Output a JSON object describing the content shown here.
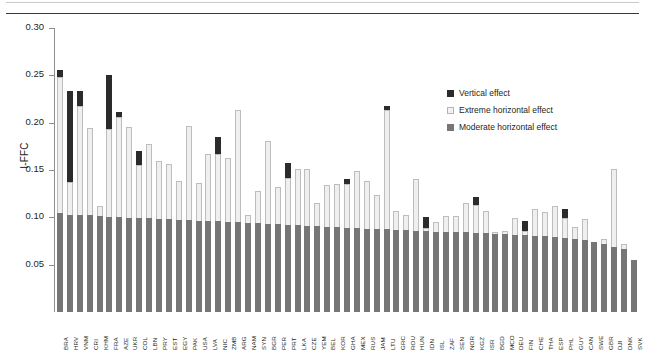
{
  "figure": {
    "caption_fragment_left": "",
    "caption_fragment_mid": "",
    "caption_fragment_right": ""
  },
  "legend": {
    "position": "top-right",
    "items": [
      {
        "label": "Vertical effect",
        "color": "#2b2b2b",
        "name": "legend-vertical-effect"
      },
      {
        "label": "Extreme horizontal effect",
        "color": "#f2f2f2",
        "name": "legend-extreme-horizontal-effect"
      },
      {
        "label": "Moderate horizontal effect",
        "color": "#767676",
        "name": "legend-moderate-horizontal-effect"
      }
    ]
  },
  "chart_data": {
    "type": "bar",
    "stacked": true,
    "title": "",
    "xlabel": "",
    "ylabel": "I-FFC",
    "ylim": [
      0,
      0.3
    ],
    "yticks": [
      0.05,
      0.1,
      0.15,
      0.2,
      0.25,
      0.3
    ],
    "ytick_labels": [
      "0.05",
      "0.10",
      "0.15",
      "0.20",
      "0.25",
      "0.30"
    ],
    "grid": false,
    "legend_position": "top-right",
    "categories": [
      "BRA",
      "HRV",
      "VNM",
      "CRI",
      "KHM",
      "FRA",
      "AZE",
      "UKR",
      "COL",
      "LBN",
      "PRY",
      "EST",
      "EGY",
      "PAK",
      "USA",
      "LVA",
      "NIC",
      "ZMB",
      "ARG",
      "NAM",
      "SYN",
      "BGR",
      "PER",
      "PRT",
      "LKA",
      "CZE",
      "YEM",
      "BEL",
      "KOR",
      "GHA",
      "MEX",
      "RUS",
      "JAM",
      "LTU",
      "GRC",
      "ROU",
      "HUN",
      "IDN",
      "ISL",
      "ZAF",
      "SEN",
      "NOR",
      "KGZ",
      "ISR",
      "BGD",
      "MCO",
      "DEU",
      "FIN",
      "CHE",
      "THA",
      "ESP",
      "PHL",
      "GUY",
      "CAN",
      "SWE",
      "GBR",
      "DJI",
      "DNK",
      "SVK"
    ],
    "series": [
      {
        "name": "Moderate horizontal effect",
        "color": "#767676",
        "values": [
          0.105,
          0.103,
          0.102,
          0.102,
          0.101,
          0.1,
          0.1,
          0.099,
          0.099,
          0.099,
          0.098,
          0.098,
          0.097,
          0.097,
          0.096,
          0.096,
          0.096,
          0.095,
          0.095,
          0.094,
          0.094,
          0.093,
          0.093,
          0.092,
          0.092,
          0.091,
          0.091,
          0.09,
          0.09,
          0.089,
          0.089,
          0.088,
          0.088,
          0.088,
          0.087,
          0.087,
          0.086,
          0.086,
          0.085,
          0.085,
          0.084,
          0.084,
          0.083,
          0.083,
          0.082,
          0.082,
          0.081,
          0.081,
          0.08,
          0.08,
          0.079,
          0.078,
          0.077,
          0.076,
          0.074,
          0.072,
          0.069,
          0.067,
          0.055
        ]
      },
      {
        "name": "Extreme horizontal effect",
        "color": "#efefef",
        "values": [
          0.143,
          0.034,
          0.116,
          0.092,
          0.011,
          0.093,
          0.106,
          0.096,
          0.056,
          0.079,
          0.062,
          0.058,
          0.041,
          0.1,
          0.04,
          0.071,
          0.071,
          0.068,
          0.118,
          0.008,
          0.034,
          0.088,
          0.039,
          0.05,
          0.059,
          0.06,
          0.024,
          0.044,
          0.045,
          0.046,
          0.06,
          0.05,
          0.036,
          0.125,
          0.02,
          0.015,
          0.054,
          0.003,
          0.01,
          0.016,
          0.017,
          0.031,
          0.03,
          0.024,
          0.002,
          0.004,
          0.018,
          0.005,
          0.029,
          0.026,
          0.033,
          0.021,
          0.013,
          0.022,
          0.0,
          0.005,
          0.082,
          0.005,
          0.0
        ]
      },
      {
        "name": "Vertical effect",
        "color": "#2b2b2b",
        "values": [
          0.008,
          0.096,
          0.015,
          0.0,
          0.0,
          0.057,
          0.005,
          0.0,
          0.015,
          0.0,
          0.0,
          0.0,
          0.0,
          0.0,
          0.0,
          0.0,
          0.018,
          0.0,
          0.0,
          0.0,
          0.0,
          0.0,
          0.0,
          0.015,
          0.0,
          0.0,
          0.0,
          0.0,
          0.0,
          0.006,
          0.0,
          0.0,
          0.0,
          0.005,
          0.0,
          0.0,
          0.0,
          0.011,
          0.0,
          0.0,
          0.0,
          0.0,
          0.008,
          0.0,
          0.0,
          0.0,
          0.0,
          0.01,
          0.0,
          0.0,
          0.0,
          0.01,
          0.0,
          0.0,
          0.0,
          0.0,
          0.0,
          0.0,
          0.0
        ]
      }
    ]
  }
}
